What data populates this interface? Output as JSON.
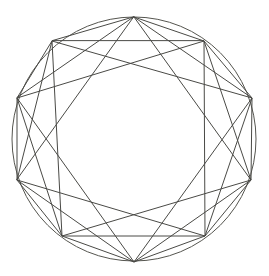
{
  "figure": {
    "title": "Inscribed Octagram Geometric Construction",
    "type": "line-drawing",
    "background_color": "#ffffff",
    "stroke_color": "#4a4a46",
    "stroke_width": 1,
    "canvas": {
      "width": 269,
      "height": 276
    }
  },
  "geometry": {
    "circle": {
      "name": "outer-circle",
      "center_x": 134,
      "center_y": 139,
      "radius_x": 122,
      "radius_y": 122,
      "visible": true
    },
    "polygon": {
      "name": "inscribed-octagon",
      "sides": 8,
      "vertex_count": 8,
      "rotation_degrees": 22.5,
      "vertices": [
        {
          "id": "v0",
          "label": "top",
          "x": 134,
          "y": 17
        },
        {
          "id": "v1",
          "label": "upper-right",
          "x": 204,
          "y": 41
        },
        {
          "id": "v2",
          "label": "right-upper",
          "x": 252,
          "y": 98
        },
        {
          "id": "v3",
          "label": "right-lower",
          "x": 251,
          "y": 180
        },
        {
          "id": "v4",
          "label": "lower-right",
          "x": 205,
          "y": 236
        },
        {
          "id": "v5",
          "label": "bottom",
          "x": 134,
          "y": 262
        },
        {
          "id": "v6",
          "label": "lower-left",
          "x": 62,
          "y": 236
        },
        {
          "id": "v7",
          "label": "left-lower",
          "x": 17,
          "y": 180
        },
        {
          "id": "v8",
          "label": "left-upper",
          "x": 17,
          "y": 98
        },
        {
          "id": "v9",
          "label": "upper-left",
          "x": 52,
          "y": 41
        }
      ]
    },
    "star_polygons": [
      {
        "name": "octagram-8-3",
        "schlafli": "{8/3}",
        "step": 3,
        "description": "Eight-pointed star connecting every third vertex"
      },
      {
        "name": "octagram-8-2",
        "schlafli": "{8/2}",
        "step": 2,
        "description": "Two overlapping squares connecting every second vertex"
      }
    ],
    "chord_count": 24
  },
  "chart_data": {
    "type": "scatter",
    "title": "Inscribed Octagram Geometric Construction",
    "xlabel": "",
    "ylabel": "",
    "xlim": [
      0,
      269
    ],
    "ylim": [
      0,
      276
    ],
    "grid": false,
    "legend": "none",
    "series": [
      {
        "name": "octagon-vertices",
        "x": [
          134,
          204,
          252,
          251,
          205,
          134,
          62,
          17
        ],
        "y": [
          17,
          41,
          98,
          180,
          236,
          262,
          236,
          180
        ]
      }
    ],
    "annotations": []
  }
}
